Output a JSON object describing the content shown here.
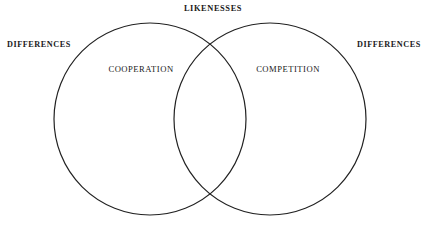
{
  "diagram": {
    "type": "venn-two-set",
    "title_top": "LIKENESSES",
    "background_color": "#ffffff",
    "stroke_color": "#222222",
    "text_color": "#1a1a1a",
    "labels": {
      "top_center": "LIKENESSES",
      "outer_left": "DIFFERENCES",
      "outer_right": "DIFFERENCES",
      "left_set": "COOPERATION",
      "right_set": "COMPETITION"
    },
    "circles": [
      {
        "name": "left-circle",
        "label": "COOPERATION",
        "cx": 150,
        "cy": 119,
        "r": 96
      },
      {
        "name": "right-circle",
        "label": "COMPETITION",
        "cx": 270,
        "cy": 119,
        "r": 96
      }
    ]
  }
}
